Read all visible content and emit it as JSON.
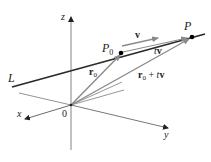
{
  "figure": {
    "type": "3d-vector-line-diagram",
    "axes": {
      "x_label": "x",
      "y_label": "y",
      "z_label": "z",
      "origin_label": "0"
    },
    "line_label": "L",
    "points": {
      "p0": {
        "label_main": "P",
        "label_sub": "0"
      },
      "p": {
        "label": "P"
      }
    },
    "vectors": {
      "v": {
        "label": "v"
      },
      "tv": {
        "label_t": "t",
        "label_v": "v"
      },
      "r0": {
        "label_main": "r",
        "label_sub": "0"
      },
      "r0_plus_tv": {
        "label_r": "r",
        "label_sub": "0",
        "label_rest_op": " + ",
        "label_t": "t",
        "label_v": "v"
      }
    },
    "colors": {
      "line_L": "#2a2a2a",
      "axis": "#555555",
      "vector_gray": "#8a8a8a",
      "point": "#000000"
    }
  }
}
